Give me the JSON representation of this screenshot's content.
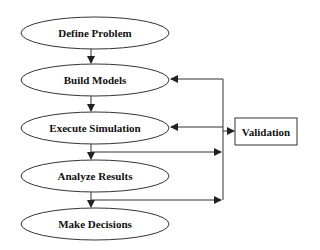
{
  "diagram": {
    "type": "flowchart",
    "nodes": [
      {
        "id": "n1",
        "label": "Define Problem",
        "shape": "ellipse"
      },
      {
        "id": "n2",
        "label": "Build Models",
        "shape": "ellipse"
      },
      {
        "id": "n3",
        "label": "Execute Simulation",
        "shape": "ellipse"
      },
      {
        "id": "n4",
        "label": "Analyze Results",
        "shape": "ellipse"
      },
      {
        "id": "n5",
        "label": "Make Decisions",
        "shape": "ellipse"
      },
      {
        "id": "v",
        "label": "Validation",
        "shape": "rectangle"
      }
    ],
    "edges": [
      {
        "from": "n1",
        "to": "n2"
      },
      {
        "from": "n2",
        "to": "n3"
      },
      {
        "from": "n3",
        "to": "n4"
      },
      {
        "from": "n4",
        "to": "n5"
      },
      {
        "from": "n3",
        "to": "validation-bus"
      },
      {
        "from": "n4",
        "to": "validation-bus"
      },
      {
        "from": "validation-bus",
        "to": "v"
      },
      {
        "from": "validation-bus",
        "to": "n2"
      },
      {
        "from": "validation-bus",
        "to": "n3"
      }
    ],
    "colors": {
      "stroke": "#222222",
      "background": "#ffffff",
      "text": "#111111"
    }
  }
}
